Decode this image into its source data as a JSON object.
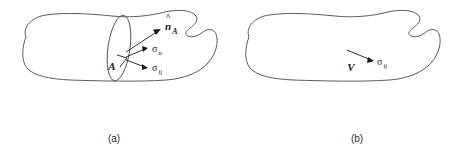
{
  "figure": {
    "background_color": "#ffffff",
    "outline_color": "#4a4a4a",
    "label_color": "#1a1a1a",
    "panels": [
      {
        "id": "a",
        "caption": "(a)",
        "labels": {
          "area": "A",
          "normal_vector": "n",
          "normal_vector_subscript": "A",
          "normal_vector_accent": "^",
          "sigma_normal_symbol": "σ",
          "sigma_normal_subscript": "n",
          "sigma_tensor_symbol": "σ",
          "sigma_tensor_subscript": "ij"
        }
      },
      {
        "id": "b",
        "caption": "(b)",
        "labels": {
          "volume": "V",
          "sigma_tensor_symbol": "σ",
          "sigma_tensor_subscript": "ij"
        }
      }
    ]
  }
}
